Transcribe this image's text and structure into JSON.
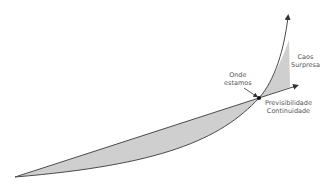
{
  "diagram": {
    "labels": {
      "chaos_line1": "Caos",
      "chaos_line2": "Surpresa",
      "here_line1": "Onde",
      "here_line2": "estamos",
      "predict_line1": "Previsibilidade",
      "predict_line2": "Continuidade"
    },
    "colors": {
      "fill": "#cfcfcf",
      "line": "#4a4a4a",
      "text": "#555555",
      "background": "#ffffff"
    }
  }
}
